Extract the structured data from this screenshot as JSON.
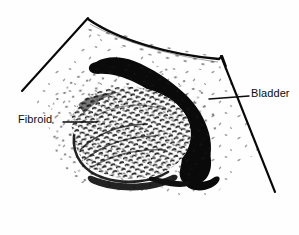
{
  "figure": {
    "type": "medical-illustration",
    "modality": "pelvic-ultrasound-line-drawing",
    "background_color": "#fefefe",
    "ink_color": "#0b0b0b"
  },
  "labels": {
    "bladder": "Bladder",
    "fibroid": "Fibroid"
  },
  "annotations": [
    {
      "name": "bladder",
      "text": "Bladder",
      "text_x": 251,
      "text_y": 88,
      "leader_from_x": 249,
      "leader_from_y": 96,
      "leader_to_x": 209,
      "leader_to_y": 99
    },
    {
      "name": "fibroid",
      "text": "Fibroid",
      "text_x": 18,
      "text_y": 114,
      "leader_from_x": 63,
      "leader_from_y": 122,
      "leader_to_x": 97,
      "leader_to_y": 122
    }
  ],
  "structures": [
    {
      "name": "scan-sector-left-edge",
      "description": "left boundary line of ultrasound sector",
      "points": "22,91 88,18"
    },
    {
      "name": "scan-sector-right-edge",
      "description": "right boundary line of ultrasound sector",
      "points": "221,57 275,192"
    },
    {
      "name": "abdominal-wall-band",
      "description": "curved bright band across top of sector"
    },
    {
      "name": "bladder-cavity",
      "description": "black anechoic S-shaped fluid-filled bladder"
    },
    {
      "name": "fibroid-mass",
      "description": "large heterogeneous stippled oval mass"
    },
    {
      "name": "speckle-field",
      "description": "scattered stipple artifact dots in far field"
    }
  ]
}
